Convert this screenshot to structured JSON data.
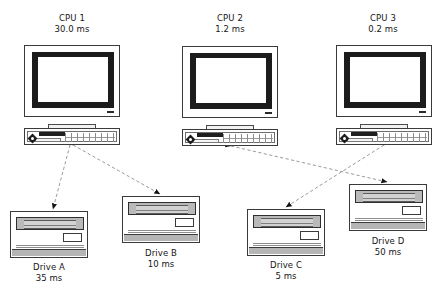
{
  "diagram": {
    "type": "node-link",
    "background": "#ffffff",
    "line_color": "#8a8a8a",
    "arrow_color": "#1a1a1a"
  },
  "cpus": [
    {
      "id": "cpu1",
      "name": "CPU 1",
      "time": "30.0 ms",
      "icon": "desktop-computer-icon"
    },
    {
      "id": "cpu2",
      "name": "CPU 2",
      "time": "1.2 ms",
      "icon": "desktop-computer-icon"
    },
    {
      "id": "cpu3",
      "name": "CPU 3",
      "time": "0.2 ms",
      "icon": "desktop-computer-icon"
    }
  ],
  "drives": [
    {
      "id": "driveA",
      "name": "Drive A",
      "time": "35 ms",
      "icon": "disk-drive-icon"
    },
    {
      "id": "driveB",
      "name": "Drive B",
      "time": "10 ms",
      "icon": "disk-drive-icon"
    },
    {
      "id": "driveC",
      "name": "Drive C",
      "time": "5 ms",
      "icon": "disk-drive-icon"
    },
    {
      "id": "driveD",
      "name": "Drive D",
      "time": "50 ms",
      "icon": "disk-drive-icon"
    }
  ],
  "connections": [
    {
      "from": "cpu1",
      "to": "driveA",
      "style": "dashed",
      "arrows": "both"
    },
    {
      "from": "cpu1",
      "to": "driveB",
      "style": "dashed",
      "arrows": "both"
    },
    {
      "from": "cpu2",
      "to": "driveD",
      "style": "dashed",
      "arrows": "both"
    },
    {
      "from": "cpu3",
      "to": "driveC",
      "style": "dashed",
      "arrows": "both"
    }
  ]
}
